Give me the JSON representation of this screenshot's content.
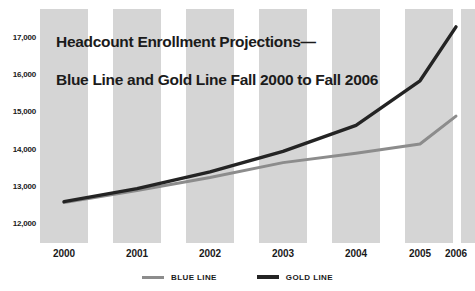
{
  "chart_data": {
    "type": "line",
    "title": "Headcount Enrollment Projections—\nBlue Line and Gold Line Fall 2000 to Fall 2006",
    "title_line1": "Headcount Enrollment Projections—",
    "title_line2": "Blue Line and Gold Line Fall 2000 to Fall 2006",
    "xlabel": "",
    "ylabel": "",
    "categories": [
      "2000",
      "2001",
      "2002",
      "2003",
      "2004",
      "2005",
      "2006"
    ],
    "x": [
      2000,
      2001,
      2002,
      2003,
      2004,
      2005,
      2006
    ],
    "ylim": [
      11600,
      17600
    ],
    "yticks": [
      12000,
      13000,
      14000,
      15000,
      16000,
      17000
    ],
    "ytick_labels": [
      "12,000",
      "13,000",
      "14,000",
      "15,000",
      "16,000",
      "17,000"
    ],
    "grid": false,
    "background_bands": true,
    "band_color": "#d5d5d5",
    "legend_position": "bottom-center",
    "series": [
      {
        "name": "BLUE LINE",
        "color": "#8c8c8c",
        "width": 3,
        "values": [
          12580,
          12900,
          13250,
          13650,
          13900,
          14150,
          14900
        ]
      },
      {
        "name": "GOLD LINE",
        "color": "#242424",
        "width": 3.4,
        "values": [
          12600,
          12950,
          13400,
          13950,
          14650,
          15850,
          17300
        ]
      }
    ]
  },
  "legend": {
    "items": [
      {
        "label": "BLUE LINE",
        "color": "#8c8c8c"
      },
      {
        "label": "GOLD LINE",
        "color": "#242424"
      }
    ]
  }
}
